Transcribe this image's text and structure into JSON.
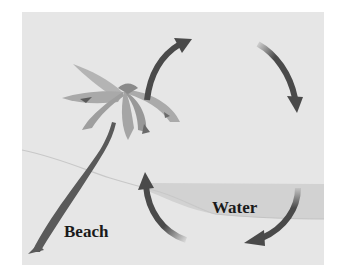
{
  "diagram": {
    "labels": {
      "beach": "Beach",
      "water": "Water"
    },
    "elements": [
      {
        "name": "palm-tree",
        "location": "beach"
      },
      {
        "name": "circulation-arrows",
        "count": 4,
        "direction": "clockwise"
      },
      {
        "name": "water-band"
      },
      {
        "name": "shoreline"
      }
    ],
    "colors": {
      "background": "#e6e6e6",
      "arrow": "#4a4a4a",
      "water": "#cfcfcf",
      "palm_leaf": "#a8a8a8",
      "trunk": "#5a5a5a",
      "text": "#1a1a1a"
    }
  }
}
